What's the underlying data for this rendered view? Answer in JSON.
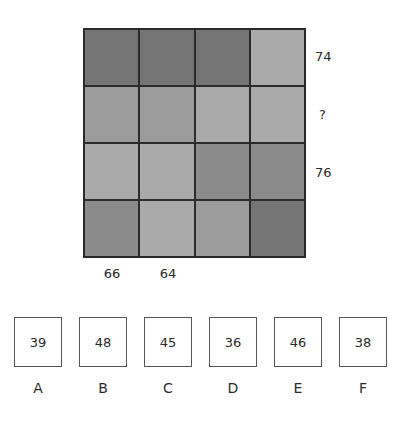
{
  "puzzle": {
    "grid": {
      "rows": 4,
      "cols": 4,
      "shades": {
        "dark": "#757575",
        "medium_dark": "#8b8b8b",
        "medium": "#9b9b9b",
        "light": "#aaaaaa"
      },
      "cells": [
        [
          "dark",
          "dark",
          "dark",
          "light"
        ],
        [
          "medium",
          "medium",
          "light",
          "light"
        ],
        [
          "light",
          "light",
          "medium_dark",
          "medium_dark"
        ],
        [
          "medium_dark",
          "light",
          "medium",
          "dark"
        ]
      ],
      "border_color": "#2b2b2b"
    },
    "row_labels": [
      "74",
      "?",
      "76",
      ""
    ],
    "col_labels": [
      "66",
      "64",
      "",
      ""
    ]
  },
  "options": [
    {
      "letter": "A",
      "value": "39"
    },
    {
      "letter": "B",
      "value": "48"
    },
    {
      "letter": "C",
      "value": "45"
    },
    {
      "letter": "D",
      "value": "36"
    },
    {
      "letter": "E",
      "value": "46"
    },
    {
      "letter": "F",
      "value": "38"
    }
  ]
}
